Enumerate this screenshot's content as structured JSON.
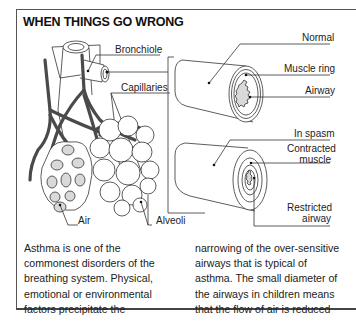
{
  "title": "WHEN THINGS GO WRONG",
  "labels": {
    "bronchiole": "Bronchiole",
    "capillaries": "Capillaries",
    "air": "Air",
    "alveoli": "Alveoli",
    "normal": "Normal",
    "muscle_ring": "Muscle ring",
    "airway": "Airway",
    "in_spasm": "In spasm",
    "contracted_muscle_1": "Contracted",
    "contracted_muscle_2": "muscle",
    "restricted_airway_1": "Restricted",
    "restricted_airway_2": "airway"
  },
  "text": {
    "col1": [
      "Asthma is one of the",
      "commonest disorders of the",
      "breathing system. Physical,",
      "emotional or environmental",
      "factors precipitate the"
    ],
    "col2": [
      "narrowing of the over-sensitive",
      "airways that is typical of",
      "asthma. The small diameter of",
      "the airways in children means",
      "that the flow of air is reduced"
    ]
  },
  "colors": {
    "vessel": "#4a4a4a",
    "airway_fill": "#d9d9d9",
    "line": "#333333"
  }
}
